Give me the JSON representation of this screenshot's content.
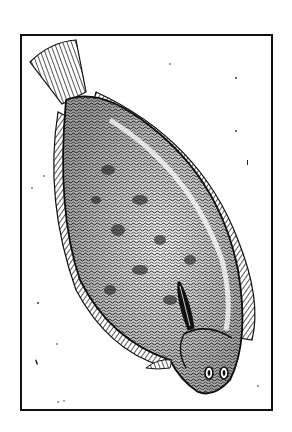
{
  "illustration": {
    "subject": "flatfish engraving",
    "style": "black-and-white woodcut",
    "colors": {
      "ink": "#111111",
      "paper": "#ffffff"
    }
  }
}
